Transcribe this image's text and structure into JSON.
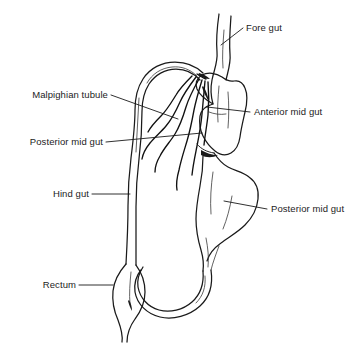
{
  "figure": {
    "background_color": "#ffffff",
    "line_color": "#1a1a1a",
    "text_color": "#1c1c1c"
  },
  "labels": {
    "fore_gut": "Fore gut",
    "anterior_mid_gut": "Anterior mid gut",
    "posterior_mid_gut_left": "Posterior mid gut",
    "posterior_mid_gut_right": "Posterior mid gut",
    "malpighian_tubule": "Malpighian tubule",
    "hind_gut": "Hind gut",
    "rectum": "Rectum"
  },
  "parts": [
    {
      "id": "fore-gut",
      "name": "Fore gut",
      "label_side": "right"
    },
    {
      "id": "anterior-mid-gut",
      "name": "Anterior mid gut",
      "label_side": "right"
    },
    {
      "id": "posterior-mid-gut",
      "name": "Posterior mid gut",
      "label_side": "right"
    },
    {
      "id": "posterior-mid-gut-proximal",
      "name": "Posterior mid gut",
      "label_side": "left"
    },
    {
      "id": "malpighian-tubule",
      "name": "Malpighian tubule",
      "label_side": "left"
    },
    {
      "id": "hind-gut",
      "name": "Hind gut",
      "label_side": "left"
    },
    {
      "id": "rectum",
      "name": "Rectum",
      "label_side": "left"
    }
  ]
}
